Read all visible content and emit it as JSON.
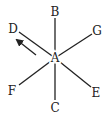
{
  "diagram": {
    "center": {
      "label": "A",
      "x": 55,
      "y": 58
    },
    "line_color": "#222222",
    "spokes": [
      {
        "label": "B",
        "end_x": 55,
        "end_y": 18,
        "label_x": 55,
        "label_y": 16
      },
      {
        "label": "G",
        "end_x": 92,
        "end_y": 34,
        "label_x": 97,
        "label_y": 35
      },
      {
        "label": "D",
        "end_x": 19,
        "end_y": 32,
        "label_x": 13,
        "label_y": 33
      },
      {
        "label": "F",
        "end_x": 19,
        "end_y": 85,
        "label_x": 12,
        "label_y": 95
      },
      {
        "label": "E",
        "end_x": 91,
        "end_y": 87,
        "label_x": 96,
        "label_y": 97
      },
      {
        "label": "C",
        "end_x": 55,
        "end_y": 100,
        "label_x": 55,
        "label_y": 112
      }
    ],
    "arrow": {
      "from_x": 36,
      "from_y": 55,
      "to_x": 17,
      "to_y": 40,
      "direction": "toward D"
    }
  }
}
